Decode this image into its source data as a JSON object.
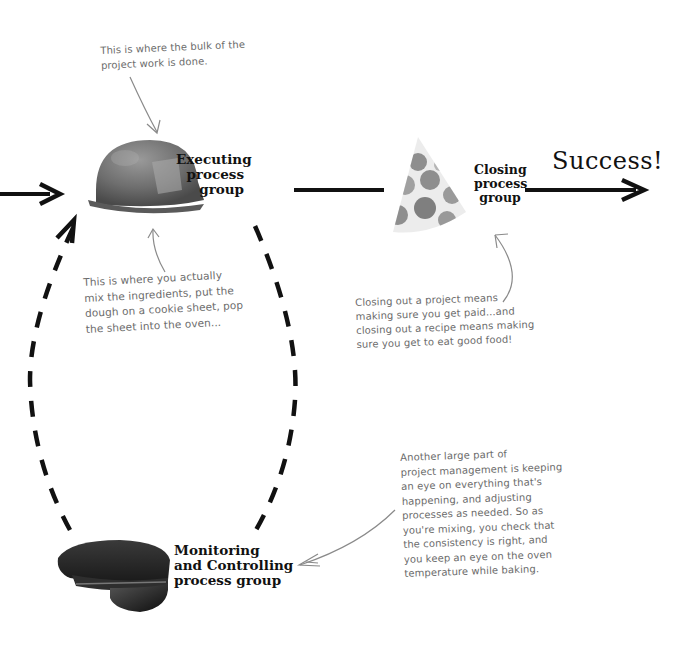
{
  "diagram": {
    "nodes": {
      "executing": {
        "label": "Executing\nprocess\ngroup",
        "icon": "hard-hat-icon"
      },
      "closing": {
        "label": "Closing\nprocess\ngroup",
        "icon": "party-hat-icon"
      },
      "monitoring": {
        "label": "Monitoring\nand Controlling\nprocess group",
        "icon": "police-cap-icon"
      }
    },
    "outcome": "Success!",
    "annotations": {
      "executing_top": "This is where the bulk of the\nproject work is done.",
      "executing_bottom": "This is where you actually\nmix the ingredients, put the\ndough on a cookie sheet, pop\nthe sheet into the oven...",
      "closing": "Closing out a project means\nmaking sure you get paid...and\nclosing out a recipe means making\nsure you get to eat good food!",
      "monitoring": "Another large part of\nproject management is keeping\nan eye on everything that's\nhappening, and adjusting\nprocesses as needed. So as\nyou're mixing, you check that\nthe consistency is right, and\nyou keep an eye on the oven\ntemperature while baking."
    },
    "colors": {
      "arrow": "#111111",
      "annotation_text": "#6b6b6b",
      "annotation_arrow": "#8a8a8a",
      "hard_hat": "#7a7a7a",
      "police_cap": "#2a2a2a",
      "party_hat_dots": "#8c8c8c"
    }
  }
}
